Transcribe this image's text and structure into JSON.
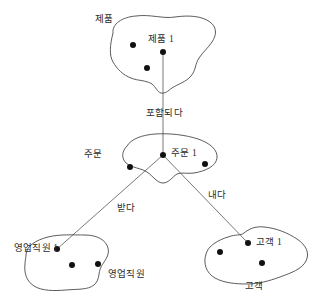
{
  "diagram": {
    "type": "entity-relationship-set-diagram",
    "background_color": "#ffffff",
    "outline_color": "#4a4a4a",
    "line_color": "#6a6a6a",
    "dot_color": "#111111",
    "entity_sets": [
      {
        "id": "product",
        "set_label": "제품",
        "instance_label": "제품 1",
        "instance_count": 3
      },
      {
        "id": "order",
        "set_label": "주문",
        "instance_label": "주문 1",
        "instance_count": 3
      },
      {
        "id": "salesperson",
        "set_label": "영업직원",
        "instance_label": "영업직원 1",
        "instance_count": 3
      },
      {
        "id": "customer",
        "set_label": "고객",
        "instance_label": "고객 1",
        "instance_count": 3
      }
    ],
    "relationships": [
      {
        "id": "contains",
        "label": "포함되다",
        "from": "product",
        "to": "order"
      },
      {
        "id": "receives",
        "label": "받다",
        "from": "order",
        "to": "salesperson"
      },
      {
        "id": "issues",
        "label": "내다",
        "from": "order",
        "to": "customer"
      }
    ]
  }
}
